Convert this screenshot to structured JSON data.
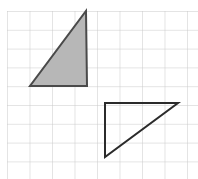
{
  "header": {
    "label": "ONUS ▶",
    "clipped": true
  },
  "figure": {
    "name": "grid-with-two-right-triangles",
    "canvas": {
      "width": 198,
      "height": 179,
      "background": "#ffffff"
    },
    "grid": {
      "line_color": "#c9c9c9",
      "line_width": 1,
      "origin_x": 7,
      "origin_y": 11,
      "cell_width": 22.5,
      "cell_height": 18.8,
      "columns": 9,
      "rows": 9
    },
    "shapes": [
      {
        "name": "shaded-triangle",
        "type": "triangle",
        "fill": "#b7b7b7",
        "stroke": "#4a4a4a",
        "stroke_width": 2,
        "points": "86,11 87,86 30,86",
        "vertices": [
          [
            86,
            11
          ],
          [
            87,
            86
          ],
          [
            30,
            86
          ]
        ],
        "description": "shaded right triangle, right angle at bottom-right, apex at top-right"
      },
      {
        "name": "unshaded-triangle",
        "type": "triangle",
        "fill": "none",
        "stroke": "#2b2b2b",
        "stroke_width": 2,
        "points": "105,103 178,103 105,157",
        "vertices": [
          [
            105,
            103
          ],
          [
            178,
            103
          ],
          [
            105,
            157
          ]
        ],
        "description": "outlined right triangle, right angle at top-left, hypotenuse from bottom-left to top-right"
      }
    ]
  }
}
